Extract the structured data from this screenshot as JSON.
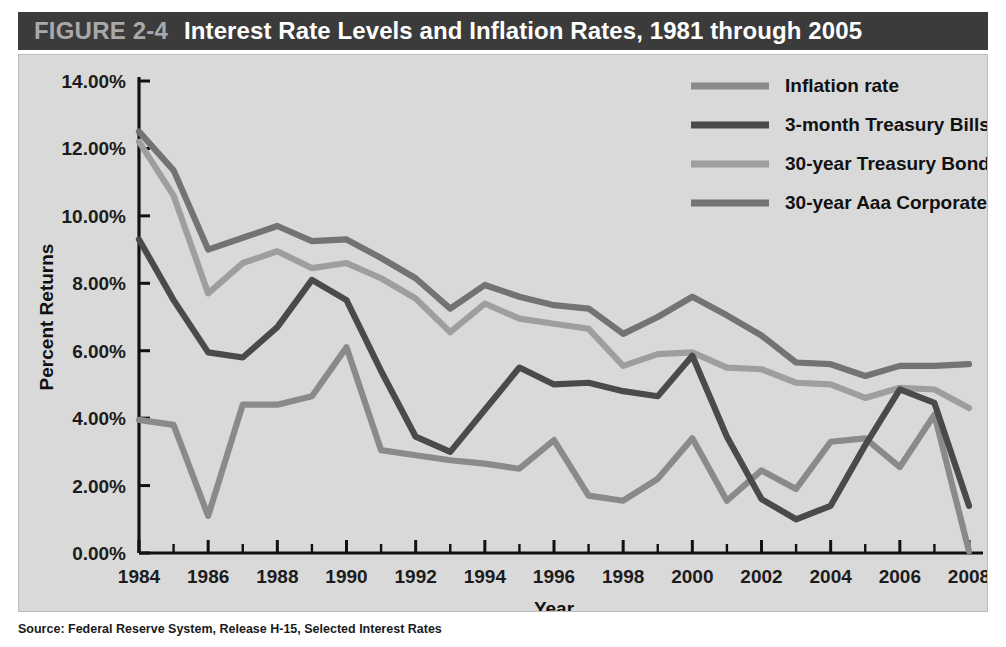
{
  "figure": {
    "number_label": "FIGURE 2-4",
    "title": "Interest Rate Levels and Inflation Rates, 1981 through 2005",
    "source": "Source: Federal Reserve System, Release H-15, Selected Interest Rates"
  },
  "colors": {
    "band_background": "#3b3b3b",
    "band_number_text": "#a9a9a9",
    "band_title_text": "#ffffff",
    "panel_background": "#d9d9d9",
    "axis": "#111111",
    "inflation_rate": "#8a8a8a",
    "treasury_bills_3month": "#4a4a4a",
    "treasury_bonds_30year": "#9e9e9e",
    "corporate_bonds_aaa_30year": "#737373"
  },
  "chart_data": {
    "type": "line",
    "title": "Interest Rate Levels and Inflation Rates, 1981 through 2005",
    "xlabel": "Year",
    "ylabel": "Percent Returns",
    "xlim": [
      1984,
      2008
    ],
    "ylim": [
      0,
      14
    ],
    "grid": false,
    "legend_position": "top-right",
    "x": [
      1984,
      1985,
      1986,
      1987,
      1988,
      1989,
      1990,
      1991,
      1992,
      1993,
      1994,
      1995,
      1996,
      1997,
      1998,
      1999,
      2000,
      2001,
      2002,
      2003,
      2004,
      2005,
      2006,
      2007,
      2008
    ],
    "xtick_labels": [
      "1984",
      "1986",
      "1988",
      "1990",
      "1992",
      "1994",
      "1996",
      "1998",
      "2000",
      "2002",
      "2004",
      "2006",
      "2008"
    ],
    "ytick_labels": [
      "0.00%",
      "2.00%",
      "4.00%",
      "6.00%",
      "8.00%",
      "10.00%",
      "12.00%",
      "14.00%"
    ],
    "ytick_values": [
      0,
      2,
      4,
      6,
      8,
      10,
      12,
      14
    ],
    "series": [
      {
        "name": "Inflation rate",
        "color": "#8a8a8a",
        "values": [
          3.95,
          3.8,
          1.1,
          4.4,
          4.4,
          4.65,
          6.1,
          3.05,
          2.9,
          2.75,
          2.65,
          2.5,
          3.35,
          1.7,
          1.55,
          2.2,
          3.4,
          1.55,
          2.45,
          1.9,
          3.3,
          3.4,
          2.55,
          4.1,
          0.05
        ]
      },
      {
        "name": "3-month Treasury Bills",
        "color": "#4a4a4a",
        "values": [
          9.3,
          7.5,
          5.95,
          5.8,
          6.7,
          8.1,
          7.5,
          5.4,
          3.45,
          3.0,
          4.25,
          5.5,
          5.0,
          5.05,
          4.8,
          4.65,
          5.85,
          3.45,
          1.6,
          1.0,
          1.4,
          3.2,
          4.85,
          4.45,
          1.4
        ]
      },
      {
        "name": "30-year Treasury Bonds",
        "color": "#9e9e9e",
        "values": [
          12.2,
          10.6,
          7.7,
          8.6,
          8.95,
          8.45,
          8.6,
          8.15,
          7.55,
          6.55,
          7.4,
          6.95,
          6.8,
          6.65,
          5.55,
          5.9,
          5.95,
          5.5,
          5.45,
          5.05,
          5.0,
          4.6,
          4.9,
          4.85,
          4.3
        ]
      },
      {
        "name": "30-year Aaa Corporate Bonds",
        "color": "#737373",
        "values": [
          12.5,
          11.35,
          9.0,
          9.35,
          9.7,
          9.25,
          9.3,
          8.75,
          8.15,
          7.25,
          7.95,
          7.6,
          7.35,
          7.25,
          6.5,
          7.0,
          7.6,
          7.05,
          6.45,
          5.65,
          5.6,
          5.25,
          5.55,
          5.55,
          5.6
        ]
      }
    ]
  }
}
